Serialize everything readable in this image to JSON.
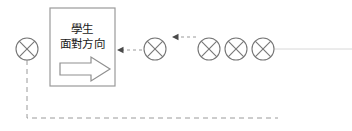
{
  "diagram": {
    "colors": {
      "stroke": "#808080",
      "box_stroke": "#9a9a9a",
      "text": "#1a1a1a",
      "dashed": "#9a9a9a",
      "faint_line": "#d8d8d8",
      "background": "#ffffff"
    },
    "box": {
      "name": "student-facing-direction-box",
      "x": 50,
      "y": 8,
      "width": 65,
      "height": 78,
      "label_line1": "學生",
      "label_line2": "面對方向",
      "arrow_label": "right-pointing-arrow"
    },
    "seats": [
      {
        "id": "seat-left-isolated",
        "cx": 27,
        "cy": 49,
        "r": 11
      },
      {
        "id": "seat-middle",
        "cx": 155,
        "cy": 49,
        "r": 11
      },
      {
        "id": "seat-right-1",
        "cx": 209,
        "cy": 49,
        "r": 11
      },
      {
        "id": "seat-right-2",
        "cx": 236,
        "cy": 49,
        "r": 11
      },
      {
        "id": "seat-right-3",
        "cx": 263,
        "cy": 49,
        "r": 11
      }
    ],
    "dashed_arrows": [
      {
        "id": "arrow-to-box",
        "from_x": 142,
        "to_x": 117,
        "y": 50,
        "direction": "left"
      },
      {
        "id": "arrow-to-middle-seat",
        "from_x": 196,
        "to_x": 172,
        "y": 37,
        "direction": "left"
      }
    ],
    "dashed_path": {
      "id": "wrap-around-path",
      "points": "27,60 27,118 278,118"
    },
    "faint_line": {
      "id": "row-baseline",
      "x1": 274,
      "x2": 352,
      "y": 49
    }
  }
}
